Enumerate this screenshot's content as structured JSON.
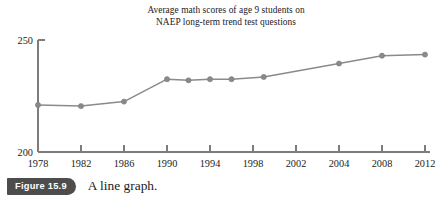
{
  "figure": {
    "badge_label": "Figure 15.9",
    "caption": "A line graph."
  },
  "chart_data": {
    "type": "line",
    "title": "Average math scores of age 9 students on NAEP long-term trend test questions",
    "title_lines": [
      "Average math scores of age 9 students on",
      "NAEP long-term trend test questions"
    ],
    "xlabel": "",
    "ylabel": "",
    "xlim": [
      1978,
      2012
    ],
    "ylim": [
      200,
      250
    ],
    "grid": false,
    "legend": "none",
    "marker": "circle",
    "line_color": "#8a8a8a",
    "marker_color": "#8a8a8a",
    "axis_color": "#7c7c7c",
    "x_tick_labels": [
      "1978",
      "1982",
      "1986",
      "1990",
      "1994",
      "1998",
      "2002",
      "2004",
      "2008",
      "2012"
    ],
    "x_tick_values": [
      1978,
      1982,
      1986,
      1990,
      1994,
      1998,
      2002,
      2004,
      2008,
      2012
    ],
    "y_tick_labels": [
      "200",
      "250"
    ],
    "y_tick_values": [
      200,
      250
    ],
    "x": [
      1978,
      1982,
      1986,
      1990,
      1992,
      1994,
      1996,
      1999,
      2004,
      2008,
      2012
    ],
    "values": [
      221,
      220.5,
      222.5,
      232.5,
      232,
      232.5,
      232.5,
      233.5,
      239.5,
      243,
      243.5
    ],
    "points": [
      {
        "x": 1978,
        "y": 221
      },
      {
        "x": 1982,
        "y": 220.5
      },
      {
        "x": 1986,
        "y": 222.5
      },
      {
        "x": 1990,
        "y": 232.5
      },
      {
        "x": 1992,
        "y": 232
      },
      {
        "x": 1994,
        "y": 232.5
      },
      {
        "x": 1996,
        "y": 232.5
      },
      {
        "x": 1999,
        "y": 233.5
      },
      {
        "x": 2004,
        "y": 239.5
      },
      {
        "x": 2008,
        "y": 243
      },
      {
        "x": 2012,
        "y": 243.5
      }
    ]
  }
}
